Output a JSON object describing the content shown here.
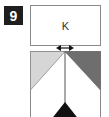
{
  "step": {
    "number": "9"
  },
  "top_box": {
    "label": "K"
  },
  "colors": {
    "badge_bg": "#1e1e1e",
    "light_triangle": "#d6d6d6",
    "dark_triangle": "#6e6e6e",
    "black_triangle": "#111111",
    "outline": "#8a8a8a"
  }
}
